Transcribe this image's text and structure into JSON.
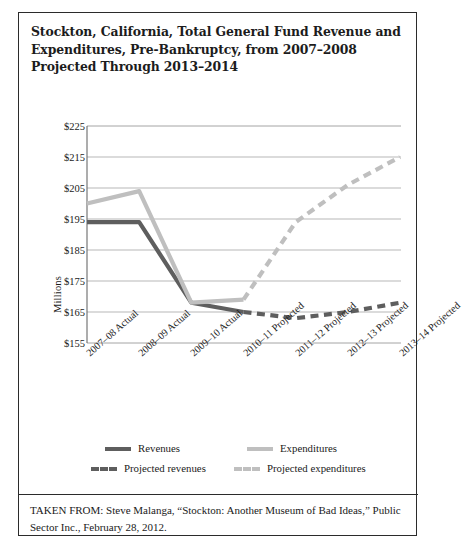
{
  "figure": {
    "title": "Stockton, California, Total General Fund Revenue and Expenditures, Pre-Bankruptcy, from 2007–2008 Projected Through 2013–2014",
    "source": "TAKEN FROM: Steve Malanga, “Stockton: Another Museum of Bad Ideas,” Public Sector Inc., February 28, 2012."
  },
  "chart_data": {
    "type": "line",
    "title": "Stockton, California, Total General Fund Revenue and Expenditures, Pre-Bankruptcy, from 2007–2008 Projected Through 2013–2014",
    "xlabel": "",
    "ylabel": "Millions",
    "categories": [
      "2007–08 Actual",
      "2008–09 Actual",
      "2009–10 Actual",
      "2010–11 Projected",
      "2011–12 Projected",
      "2012–13 Projected",
      "2013–14 Projected"
    ],
    "ylim": [
      155,
      225
    ],
    "yticks": [
      155,
      165,
      175,
      185,
      195,
      205,
      215,
      225
    ],
    "ytick_labels": [
      "$155",
      "$165",
      "$175",
      "$185",
      "$195",
      "$205",
      "$215",
      "$225"
    ],
    "grid": true,
    "legend_position": "bottom",
    "series": [
      {
        "name": "Revenues",
        "style": "solid",
        "color": "#5e5e5e",
        "values": [
          194,
          194,
          168,
          165,
          null,
          null,
          null
        ]
      },
      {
        "name": "Expenditures",
        "style": "solid",
        "color": "#bfbfbf",
        "values": [
          200,
          204,
          168,
          169,
          null,
          null,
          null
        ]
      },
      {
        "name": "Projected revenues",
        "style": "dashed",
        "color": "#5e5e5e",
        "values": [
          null,
          null,
          null,
          165,
          163,
          165,
          168
        ]
      },
      {
        "name": "Projected expenditures",
        "style": "dashed",
        "color": "#bfbfbf",
        "values": [
          null,
          null,
          null,
          169,
          194,
          206,
          215
        ]
      }
    ]
  },
  "legend": {
    "items": [
      {
        "label": "Revenues",
        "swatch": "sw-solid-dark"
      },
      {
        "label": "Expenditures",
        "swatch": "sw-solid-light"
      },
      {
        "label": "Projected revenues",
        "swatch": "sw-dash-dark"
      },
      {
        "label": "Projected expenditures",
        "swatch": "sw-dash-light"
      }
    ]
  }
}
